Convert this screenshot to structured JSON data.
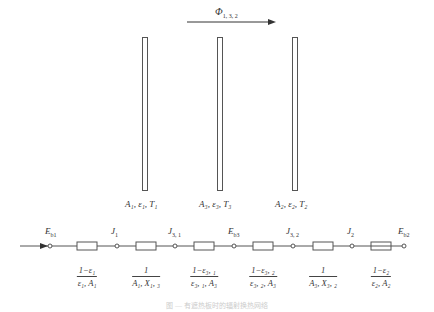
{
  "flux_label": "Φ",
  "flux_sub": "1, 3, 2",
  "plates": [
    {
      "id": "plate-1",
      "label_main": "A",
      "label": "A₁, ε₁, T₁",
      "sub": "1"
    },
    {
      "id": "plate-3",
      "label_main": "A",
      "label": "A₃, ε₃, T₃",
      "sub": "3"
    },
    {
      "id": "plate-2",
      "label_main": "A",
      "label": "A₂, ε₂, T₂",
      "sub": "2"
    }
  ],
  "nodes": [
    {
      "main": "E",
      "sub": "b1"
    },
    {
      "main": "J",
      "sub": "1"
    },
    {
      "main": "J",
      "sub": "3, 1"
    },
    {
      "main": "E",
      "sub": "b3"
    },
    {
      "main": "J",
      "sub": "3, 2"
    },
    {
      "main": "J",
      "sub": "2"
    },
    {
      "main": "E",
      "sub": "b2"
    }
  ],
  "resistances": [
    {
      "num": "1−ε₁",
      "den": "ε₁, A₁"
    },
    {
      "num": "1",
      "den": "A₁, X₁, ₃"
    },
    {
      "num": "1−ε₃, ₁",
      "den": "ε₃, ₁, A₃"
    },
    {
      "num": "1−ε₃, ₂",
      "den": "ε₃, ₂, A₃"
    },
    {
      "num": "1",
      "den": "A₃, X₃, ₂"
    },
    {
      "num": "1−ε₂",
      "den": "ε₂, A₂"
    }
  ],
  "caption": "图 — 有遮热板时的辐射换热网络"
}
